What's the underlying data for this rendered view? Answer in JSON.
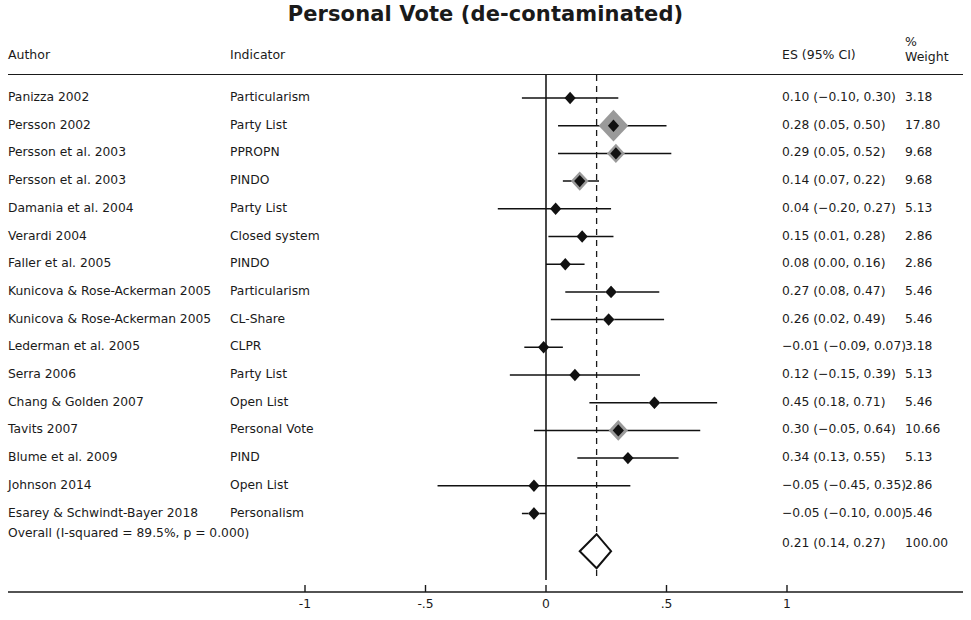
{
  "title": "Personal Vote (de-contaminated)",
  "headers": {
    "author": "Author",
    "indicator": "Indicator",
    "es": "ES (95% CI)",
    "percent": "%",
    "weight": "Weight"
  },
  "chart_data": {
    "type": "forest",
    "title": "Personal Vote (de-contaminated)",
    "xlabel": "",
    "ylabel": "",
    "xlim": [
      -1.35,
      1.35
    ],
    "xticks": [
      -1,
      -0.5,
      0,
      0.5,
      1
    ],
    "xticklabels": [
      "-1",
      "-.5",
      "0",
      ".5",
      "1"
    ],
    "null_line": 0,
    "pooled_line": 0.21,
    "grid": false,
    "legend": "none",
    "columns": [
      "Author",
      "Indicator",
      "ES (95% CI)",
      "% Weight"
    ],
    "rows": [
      {
        "author": "Panizza 2002",
        "indicator": "Particularism",
        "es": 0.1,
        "lo": -0.1,
        "hi": 0.3,
        "weight": 3.18,
        "es_label": "0.10 (−0.10, 0.30)",
        "weight_label": "3.18"
      },
      {
        "author": "Persson 2002",
        "indicator": "Party List",
        "es": 0.28,
        "lo": 0.05,
        "hi": 0.5,
        "weight": 17.8,
        "es_label": "0.28 (0.05, 0.50)",
        "weight_label": "17.80"
      },
      {
        "author": "Persson et al. 2003",
        "indicator": "PPROPN",
        "es": 0.29,
        "lo": 0.05,
        "hi": 0.52,
        "weight": 9.68,
        "es_label": "0.29 (0.05, 0.52)",
        "weight_label": "9.68"
      },
      {
        "author": "Persson et al. 2003",
        "indicator": "PINDO",
        "es": 0.14,
        "lo": 0.07,
        "hi": 0.22,
        "weight": 9.68,
        "es_label": "0.14 (0.07, 0.22)",
        "weight_label": "9.68"
      },
      {
        "author": "Damania et al. 2004",
        "indicator": "Party List",
        "es": 0.04,
        "lo": -0.2,
        "hi": 0.27,
        "weight": 5.13,
        "es_label": "0.04 (−0.20, 0.27)",
        "weight_label": "5.13"
      },
      {
        "author": "Verardi 2004",
        "indicator": "Closed system",
        "es": 0.15,
        "lo": 0.01,
        "hi": 0.28,
        "weight": 2.86,
        "es_label": "0.15 (0.01, 0.28)",
        "weight_label": "2.86"
      },
      {
        "author": "Faller et al. 2005",
        "indicator": "PINDO",
        "es": 0.08,
        "lo": 0.0,
        "hi": 0.16,
        "weight": 2.86,
        "es_label": "0.08 (0.00, 0.16)",
        "weight_label": "2.86"
      },
      {
        "author": "Kunicova & Rose-Ackerman 2005",
        "indicator": "Particularism",
        "es": 0.27,
        "lo": 0.08,
        "hi": 0.47,
        "weight": 5.46,
        "es_label": "0.27 (0.08, 0.47)",
        "weight_label": "5.46"
      },
      {
        "author": "Kunicova & Rose-Ackerman 2005",
        "indicator": "CL-Share",
        "es": 0.26,
        "lo": 0.02,
        "hi": 0.49,
        "weight": 5.46,
        "es_label": "0.26 (0.02, 0.49)",
        "weight_label": "5.46"
      },
      {
        "author": "Lederman et al. 2005",
        "indicator": "CLPR",
        "es": -0.01,
        "lo": -0.09,
        "hi": 0.07,
        "weight": 3.18,
        "es_label": "−0.01 (−0.09, 0.07)",
        "weight_label": "3.18"
      },
      {
        "author": "Serra 2006",
        "indicator": "Party List",
        "es": 0.12,
        "lo": -0.15,
        "hi": 0.39,
        "weight": 5.13,
        "es_label": "0.12 (−0.15, 0.39)",
        "weight_label": "5.13"
      },
      {
        "author": "Chang & Golden 2007",
        "indicator": "Open List",
        "es": 0.45,
        "lo": 0.18,
        "hi": 0.71,
        "weight": 5.46,
        "es_label": "0.45 (0.18, 0.71)",
        "weight_label": "5.46"
      },
      {
        "author": "Tavits 2007",
        "indicator": "Personal Vote",
        "es": 0.3,
        "lo": -0.05,
        "hi": 0.64,
        "weight": 10.66,
        "es_label": "0.30 (−0.05, 0.64)",
        "weight_label": "10.66"
      },
      {
        "author": "Blume et al. 2009",
        "indicator": "PIND",
        "es": 0.34,
        "lo": 0.13,
        "hi": 0.55,
        "weight": 5.13,
        "es_label": "0.34 (0.13, 0.55)",
        "weight_label": "5.13"
      },
      {
        "author": "Johnson 2014",
        "indicator": "Open List",
        "es": -0.05,
        "lo": -0.45,
        "hi": 0.35,
        "weight": 2.86,
        "es_label": "−0.05 (−0.45, 0.35)",
        "weight_label": "2.86"
      },
      {
        "author": "Esarey & Schwindt-Bayer 2018",
        "indicator": "Personalism",
        "es": -0.05,
        "lo": -0.1,
        "hi": 0.0,
        "weight": 5.46,
        "es_label": "−0.05 (−0.10, 0.00)",
        "weight_label": "5.46"
      }
    ],
    "overall": {
      "author": "Overall (I-squared = 89.5%, p = 0.000)",
      "indicator": "",
      "es": 0.21,
      "lo": 0.14,
      "hi": 0.27,
      "weight": 100.0,
      "es_label": "0.21 (0.14, 0.27)",
      "weight_label": "100.00"
    }
  },
  "colors": {
    "marker": "#111111",
    "halo": "#9a9a9a",
    "axis": "#1a1a1a",
    "text": "#1a1a1a"
  }
}
